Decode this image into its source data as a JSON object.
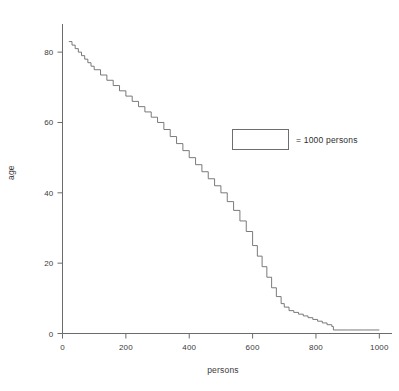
{
  "chart_data": {
    "type": "line",
    "title": "",
    "subtitle": "",
    "xlabel": "persons",
    "ylabel": "age",
    "xlim": [
      0,
      1040
    ],
    "ylim": [
      0,
      88
    ],
    "grid": false,
    "legend_position": "inside-upper-right",
    "legend": [
      {
        "marker": "rectangle",
        "label": "= 1000 persons"
      }
    ],
    "xticks": [
      0,
      200,
      400,
      600,
      800,
      1000
    ],
    "xticklabels": [
      "0",
      "200",
      "400",
      "600",
      "800",
      "1000"
    ],
    "yticks": [
      0,
      20,
      40,
      60,
      80
    ],
    "yticklabels": [
      "0",
      "20",
      "40",
      "60",
      "80"
    ],
    "series": [
      {
        "name": "age by cumulative persons",
        "style": "step",
        "color": "#6b6b6b",
        "x": [
          20,
          30,
          40,
          50,
          60,
          70,
          80,
          90,
          100,
          120,
          140,
          160,
          180,
          200,
          220,
          240,
          260,
          280,
          300,
          320,
          340,
          360,
          380,
          400,
          420,
          440,
          460,
          480,
          500,
          520,
          540,
          560,
          580,
          600,
          615,
          630,
          645,
          660,
          675,
          690,
          700,
          715,
          730,
          745,
          760,
          775,
          790,
          805,
          820,
          835,
          850,
          855,
          900,
          950,
          1000
        ],
        "y": [
          83,
          82,
          81,
          80,
          79,
          78,
          77,
          76,
          75,
          73.5,
          72,
          70.5,
          69,
          67.5,
          66,
          64.5,
          63,
          61.5,
          60,
          58,
          56,
          54,
          52,
          50,
          48,
          46,
          44,
          42,
          40,
          37.5,
          35,
          32,
          29,
          25,
          22,
          19,
          16,
          13,
          10.5,
          8.5,
          7.5,
          6.5,
          6,
          5.5,
          5,
          4.5,
          4,
          3.5,
          3,
          2.5,
          2,
          1,
          1,
          1,
          1
        ]
      }
    ]
  },
  "legend_block": {
    "swatch_name": "legend-rectangle-swatch",
    "label": "= 1000 persons"
  },
  "axes": {
    "x_title": "persons",
    "y_title": "age"
  }
}
